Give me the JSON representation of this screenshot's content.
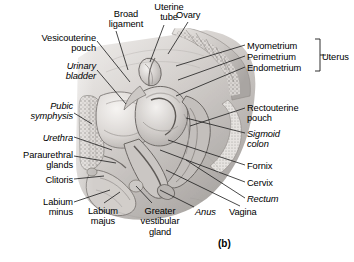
{
  "figure": {
    "caption": "(b)",
    "kind": "anatomical-illustration",
    "view": "midsagittal section of the female pelvis",
    "style": "grayscale halftone medical illustration"
  },
  "group_brackets": [
    {
      "name": "uterus-bracket",
      "label": "Uterus",
      "members": [
        "Myometrium",
        "Perimetrium",
        "Endometrium"
      ]
    }
  ],
  "labels": [
    {
      "id": "broad-ligament",
      "text": "Broad\nligament",
      "italic": false,
      "align": "center",
      "x": 101,
      "y": 9,
      "w": 50
    },
    {
      "id": "uterine-tube",
      "text": "Uterine\ntube",
      "italic": false,
      "align": "center",
      "x": 146,
      "y": 2,
      "w": 46
    },
    {
      "id": "ovary",
      "text": "Ovary",
      "italic": false,
      "align": "left",
      "x": 176,
      "y": 10,
      "w": 40
    },
    {
      "id": "vesicouterine-pouch",
      "text": "Vesicouterine\npouch",
      "italic": false,
      "align": "right",
      "x": 12,
      "y": 33,
      "w": 84
    },
    {
      "id": "urinary-bladder",
      "text": "Urinary\nbladder",
      "italic": true,
      "align": "right",
      "x": 28,
      "y": 61,
      "w": 68
    },
    {
      "id": "pubic-symphysis",
      "text": "Pubic\nsymphysis",
      "italic": true,
      "align": "right",
      "x": 8,
      "y": 101,
      "w": 65
    },
    {
      "id": "urethra",
      "text": "Urethra",
      "italic": true,
      "align": "right",
      "x": 16,
      "y": 133,
      "w": 57
    },
    {
      "id": "paraurethral-glands",
      "text": "Paraurethral\nglands",
      "italic": false,
      "align": "right",
      "x": 0,
      "y": 150,
      "w": 73
    },
    {
      "id": "clitoris",
      "text": "Clitoris",
      "italic": false,
      "align": "right",
      "x": 20,
      "y": 175,
      "w": 53
    },
    {
      "id": "labium-minus",
      "text": "Labium\nminus",
      "italic": false,
      "align": "right",
      "x": 18,
      "y": 197,
      "w": 55
    },
    {
      "id": "labium-majus",
      "text": "Labium\nmajus",
      "italic": false,
      "align": "center",
      "x": 78,
      "y": 206,
      "w": 50
    },
    {
      "id": "greater-vestibular-gland",
      "text": "Greater\nvestibular\ngland",
      "italic": false,
      "align": "center",
      "x": 130,
      "y": 206,
      "w": 60
    },
    {
      "id": "myometrium",
      "text": "Myometrium",
      "italic": false,
      "align": "left",
      "x": 247,
      "y": 41,
      "w": 66
    },
    {
      "id": "perimetrium",
      "text": "Perimetrium",
      "italic": false,
      "align": "left",
      "x": 247,
      "y": 52,
      "w": 66
    },
    {
      "id": "endometrium",
      "text": "Endometrium",
      "italic": false,
      "align": "left",
      "x": 247,
      "y": 63,
      "w": 68
    },
    {
      "id": "uterus",
      "text": "Uterus",
      "italic": false,
      "align": "left",
      "x": 322,
      "y": 52,
      "w": 40
    },
    {
      "id": "rectouterine-pouch",
      "text": "Rectouterine\npouch",
      "italic": false,
      "align": "left",
      "x": 247,
      "y": 103,
      "w": 74
    },
    {
      "id": "sigmoid-colon",
      "text": "Sigmoid\ncolon",
      "italic": true,
      "align": "left",
      "x": 247,
      "y": 129,
      "w": 52
    },
    {
      "id": "fornix",
      "text": "Fornix",
      "italic": false,
      "align": "left",
      "x": 247,
      "y": 161,
      "w": 40
    },
    {
      "id": "cervix",
      "text": "Cervix",
      "italic": false,
      "align": "left",
      "x": 247,
      "y": 178,
      "w": 40
    },
    {
      "id": "rectum",
      "text": "Rectum",
      "italic": true,
      "align": "left",
      "x": 247,
      "y": 194,
      "w": 44
    },
    {
      "id": "vagina",
      "text": "Vagina",
      "italic": false,
      "align": "left",
      "x": 229,
      "y": 207,
      "w": 42
    },
    {
      "id": "anus",
      "text": "Anus",
      "italic": true,
      "align": "left",
      "x": 195,
      "y": 207,
      "w": 32
    }
  ],
  "colors": {
    "text": "#000000",
    "leader_line": "#1a1a1a",
    "background": "#ffffff",
    "tissue_light": "#e3e0dd",
    "tissue_mid": "#b9b5b2",
    "tissue_dark": "#8d8986",
    "bone_fill": "#d8d5d2",
    "cavity_dark": "#6f6b68"
  }
}
